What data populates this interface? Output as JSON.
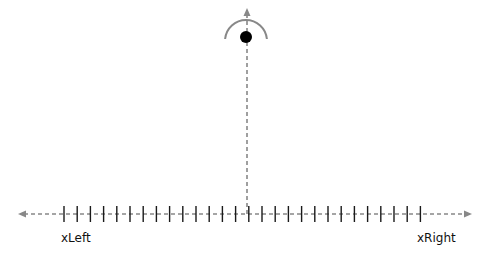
{
  "diagram": {
    "type": "number-line-with-pendulum",
    "axis": {
      "y": 214,
      "x_start": 18,
      "x_end": 472,
      "line_color": "#888888",
      "tick_color": "#1a1a1a",
      "tick_count": 28,
      "tick_start_x": 64,
      "tick_spacing": 13.2,
      "tick_half_height": 8,
      "left_label": "xLeft",
      "right_label": "xRight"
    },
    "vertical_line": {
      "x": 247,
      "y_top": 8,
      "y_bottom": 214,
      "color": "#888888"
    },
    "pendulum": {
      "bob_cx": 246,
      "bob_cy": 37,
      "bob_r": 6,
      "bob_color": "#000000",
      "arc_cx": 246,
      "arc_cy": 41,
      "arc_r": 21,
      "arc_color": "#888888"
    }
  }
}
